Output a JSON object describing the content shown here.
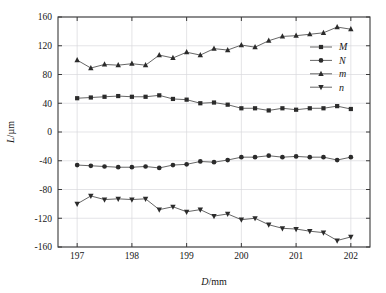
{
  "chart_data": {
    "type": "line",
    "title": "",
    "xlabel": "D/mm",
    "ylabel": "L/µm",
    "xlim": [
      196.65,
      202.35
    ],
    "ylim": [
      -160,
      160
    ],
    "grid": true,
    "legend_position": "right-inside-top",
    "xticks": [
      197,
      198,
      199,
      200,
      201,
      202
    ],
    "xticklabels": [
      "197",
      "198",
      "199",
      "200",
      "201",
      "202"
    ],
    "yticks": [
      -160,
      -120,
      -80,
      -40,
      0,
      40,
      80,
      120,
      160
    ],
    "yticklabels": [
      "-160",
      "-120",
      "-80",
      "-40",
      "0",
      "40",
      "80",
      "120",
      "160"
    ],
    "x": [
      197.0,
      197.25,
      197.5,
      197.75,
      198.0,
      198.25,
      198.5,
      198.75,
      199.0,
      199.25,
      199.5,
      199.75,
      200.0,
      200.25,
      200.5,
      200.75,
      201.0,
      201.25,
      201.5,
      201.75,
      202.0
    ],
    "series": [
      {
        "name": "M",
        "marker": "square",
        "color": "#2b2b2b",
        "values": [
          47,
          48,
          49,
          50,
          49,
          49,
          51,
          46,
          45,
          40,
          41,
          38,
          33,
          33,
          30,
          33,
          31,
          33,
          33,
          36,
          32
        ]
      },
      {
        "name": "N",
        "marker": "circle",
        "color": "#555555",
        "values": [
          -46,
          -47,
          -48,
          -49,
          -49,
          -48,
          -50,
          -46,
          -45,
          -41,
          -42,
          -39,
          -35,
          -35,
          -33,
          -35,
          -34,
          -35,
          -35,
          -39,
          -35
        ]
      },
      {
        "name": "m",
        "marker": "triangle-up",
        "color": "#2b2b2b",
        "values": [
          100,
          89,
          94,
          93,
          95,
          93,
          107,
          103,
          111,
          107,
          116,
          114,
          121,
          118,
          127,
          133,
          134,
          136,
          138,
          146,
          143
        ]
      },
      {
        "name": "n",
        "marker": "triangle-down",
        "color": "#555555",
        "values": [
          -100,
          -89,
          -94,
          -93,
          -94,
          -93,
          -108,
          -104,
          -111,
          -108,
          -117,
          -114,
          -122,
          -120,
          -129,
          -134,
          -135,
          -138,
          -140,
          -151,
          -146
        ]
      }
    ]
  },
  "legend": {
    "entries": [
      {
        "label": "M",
        "marker": "square"
      },
      {
        "label": "N",
        "marker": "circle"
      },
      {
        "label": "m",
        "marker": "triangle-up"
      },
      {
        "label": "n",
        "marker": "triangle-down"
      }
    ]
  },
  "axis_titles": {
    "x_var": "D",
    "x_unit": "/mm",
    "y_var": "L",
    "y_unit": "/µm"
  }
}
